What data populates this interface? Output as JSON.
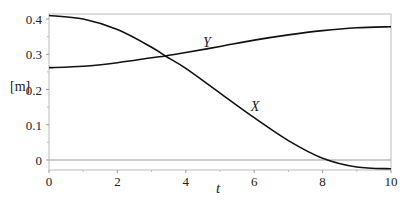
{
  "chart_data": {
    "type": "line",
    "title": "",
    "xlabel": "t",
    "ylabel": "[m]",
    "xlim": [
      0,
      10
    ],
    "ylim": [
      -0.03,
      0.415
    ],
    "xticks": [
      0,
      2,
      4,
      6,
      8,
      10
    ],
    "yticks": [
      0,
      0.1,
      0.2,
      0.3,
      0.4
    ],
    "xtick_labels": [
      "0",
      "2",
      "4",
      "6",
      "8",
      "10"
    ],
    "ytick_labels": [
      "0",
      "0.1",
      "0.2",
      "0.3",
      "0.4"
    ],
    "grid": false,
    "zero_line": true,
    "series": [
      {
        "name": "X",
        "x": [
          0,
          1,
          2,
          3,
          3.4,
          4,
          5,
          6,
          7,
          8,
          9,
          10
        ],
        "values": [
          0.41,
          0.4,
          0.37,
          0.32,
          0.295,
          0.26,
          0.19,
          0.12,
          0.055,
          0.005,
          -0.02,
          -0.025
        ]
      },
      {
        "name": "Y",
        "x": [
          0,
          1,
          2,
          3,
          3.4,
          4,
          5,
          6,
          7,
          8,
          9,
          10
        ],
        "values": [
          0.262,
          0.266,
          0.276,
          0.29,
          0.295,
          0.305,
          0.322,
          0.34,
          0.355,
          0.367,
          0.375,
          0.378
        ]
      }
    ],
    "annotations": [
      {
        "text": "Y",
        "x": 4.5,
        "y": 0.32
      },
      {
        "text": "X",
        "x": 5.9,
        "y": 0.14
      }
    ]
  }
}
